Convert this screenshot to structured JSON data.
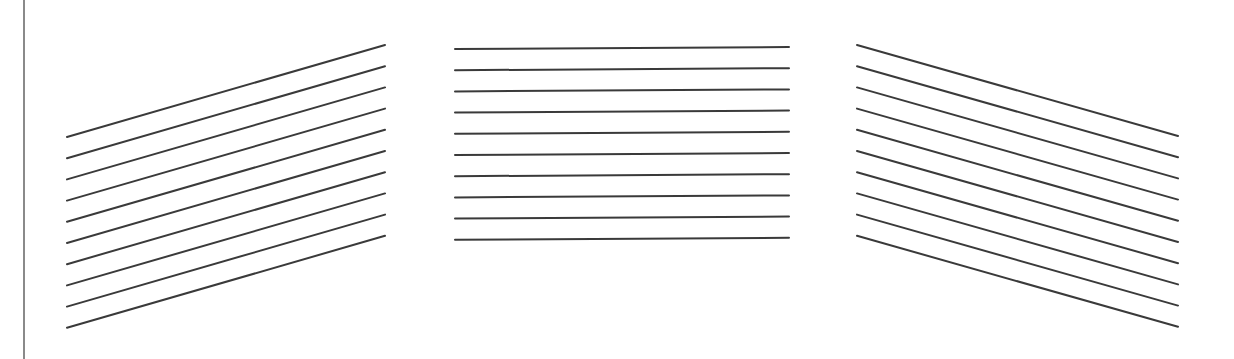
{
  "diagram": {
    "background": "#ffffff",
    "border_line": {
      "x": 24,
      "y1": 0,
      "y2": 359,
      "color": "#8a8a8a",
      "width": 2
    },
    "line_color": "#3a3a3a",
    "line_width": 2,
    "groups": [
      {
        "name": "rising-lines",
        "x1": 67,
        "x2": 385,
        "y1_start": 137,
        "y2_start": 45,
        "spacing": 21.2,
        "count": 10
      },
      {
        "name": "horizontal-lines",
        "x1": 455,
        "x2": 789,
        "y1_start": 49,
        "y2_start": 47,
        "spacing": 21.2,
        "count": 10
      },
      {
        "name": "falling-lines",
        "x1": 857,
        "x2": 1178,
        "y1_start": 45,
        "y2_start": 136,
        "spacing": 21.2,
        "count": 10
      }
    ]
  }
}
